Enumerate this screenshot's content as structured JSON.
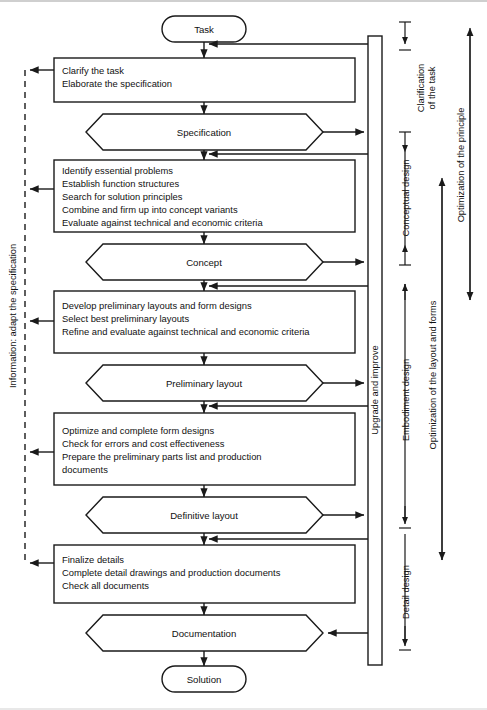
{
  "diagram": {
    "start_node": "Task",
    "end_node": "Solution",
    "stages": [
      {
        "id": "clarify",
        "type": "process",
        "lines": [
          "Clarify the task",
          "Elaborate the specification"
        ]
      },
      {
        "id": "specification",
        "type": "result",
        "label": "Specification"
      },
      {
        "id": "conceptual",
        "type": "process",
        "lines": [
          "Identify essential problems",
          "Establish function structures",
          "Search for solution principles",
          "Combine and firm up into concept variants",
          "Evaluate against technical and economic criteria"
        ]
      },
      {
        "id": "concept",
        "type": "result",
        "label": "Concept"
      },
      {
        "id": "embodiment1",
        "type": "process",
        "lines": [
          "Develop preliminary layouts and form designs",
          "Select best preliminary layouts",
          "Refine and evaluate against technical and economic criteria"
        ]
      },
      {
        "id": "preliminary_layout",
        "type": "result",
        "label": "Preliminary layout"
      },
      {
        "id": "embodiment2",
        "type": "process",
        "lines": [
          "Optimize and complete form designs",
          "Check for errors and cost effectiveness",
          "Prepare the preliminary parts list and production",
          "documents"
        ]
      },
      {
        "id": "definitive_layout",
        "type": "result",
        "label": "Definitive layout"
      },
      {
        "id": "detail",
        "type": "process",
        "lines": [
          "Finalize details",
          "Complete detail drawings and production documents",
          "Check all documents"
        ]
      },
      {
        "id": "documentation",
        "type": "result",
        "label": "Documentation"
      }
    ],
    "left_label": "Information: adapt the specification",
    "feedback_band_label": "Upgrade and improve",
    "phase_labels": [
      "Clarification of the task",
      "Conceptual design",
      "Embodiment design",
      "Detail design"
    ],
    "phase_label_lines": {
      "clarification": [
        "Clarification",
        "of the task"
      ]
    },
    "optimization_labels": [
      "Optimization of the principle",
      "Optimization of the layout and forms"
    ],
    "colors": {
      "stroke": "#1a1a1a",
      "fill": "#ffffff",
      "text": "#111111"
    }
  }
}
